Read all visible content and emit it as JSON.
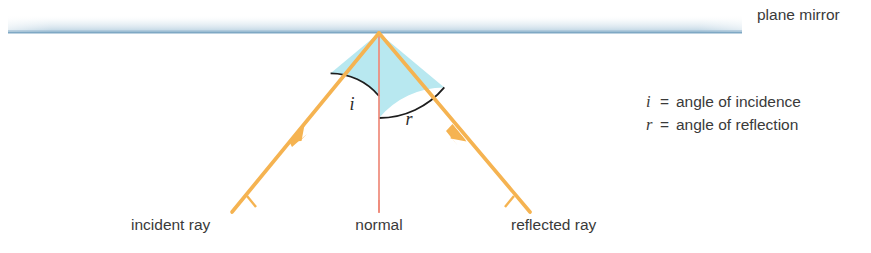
{
  "figure": {
    "title_label": "plane mirror",
    "mirror_label": "plane mirror",
    "labels": {
      "incident_ray": "incident ray",
      "normal": "normal",
      "reflected_ray": "reflected ray",
      "angle_i": "i",
      "angle_r": "r"
    },
    "legend": [
      {
        "symbol": "i",
        "equals": "=",
        "text": "angle of incidence"
      },
      {
        "symbol": "r",
        "equals": "=",
        "text": "angle of reflection"
      }
    ],
    "colors": {
      "ray": "#f5b košik",
      "ray_orange": "#f5b351",
      "normal_line": "#ef8a7a",
      "mirror_line": "#7fa8c4",
      "mirror_band_top": "#ffffff",
      "mirror_band_bottom": "#ccdde8",
      "angle_fill": "#b8e8f0",
      "arc_stroke": "#1d1d1d",
      "text": "#3a3a3a"
    },
    "geometry": {
      "vertex_x": 379,
      "vertex_y": 33,
      "mirror_y": 33,
      "mirror_x_start": 8,
      "mirror_x_end": 742,
      "normal_bottom_y": 213,
      "incident_end_x": 232,
      "incident_end_y": 212,
      "reflected_end_x": 530,
      "reflected_end_y": 212,
      "arc_radius_i": 63,
      "arc_radius_r": 85
    }
  }
}
